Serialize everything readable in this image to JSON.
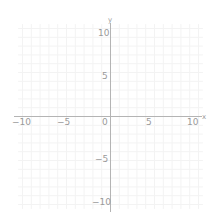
{
  "chart_data": {
    "type": "scatter",
    "title": "",
    "xlabel": "x",
    "ylabel": "y",
    "xlim": [
      -11,
      11
    ],
    "ylim": [
      -11,
      11
    ],
    "grid": true,
    "x_ticks": [
      -10,
      -5,
      0,
      5,
      10
    ],
    "y_ticks": [
      -10,
      -5,
      5,
      10
    ],
    "x_tick_labels": [
      "−10",
      "−5",
      "0",
      "5",
      "10"
    ],
    "y_tick_labels": [
      "−10",
      "−5",
      "5",
      "10"
    ],
    "series": []
  },
  "colors": {
    "axis": "#b4b4b4",
    "grid": "#f3f3f3",
    "label": "#9a9a9a",
    "background": "#ffffff"
  },
  "labels": {
    "x_axis_name": "x",
    "y_axis_name": "y",
    "origin": "0",
    "x_neg10": "−10",
    "x_neg5": "−5",
    "x_5": "5",
    "x_10": "10",
    "y_10": "10",
    "y_5": "5",
    "y_neg5": "−5",
    "y_neg10": "−10"
  }
}
